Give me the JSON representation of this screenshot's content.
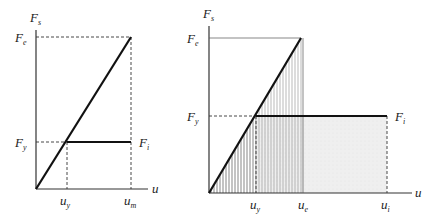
{
  "diagrams": [
    {
      "id": "left",
      "description": "Elastic vs elastoplastic force-displacement, equal displacement",
      "labels": {
        "y_axis": "F",
        "y_axis_sub": "s",
        "x_axis": "u",
        "Fe": "F",
        "Fe_sub": "e",
        "Fy": "F",
        "Fy_sub": "y",
        "Fi": "F",
        "Fi_sub": "i",
        "uy": "u",
        "uy_sub": "y",
        "um": "u",
        "um_sub": "m"
      }
    },
    {
      "id": "right",
      "description": "Elastic vs elastoplastic force-displacement, equal energy (shaded areas)",
      "labels": {
        "y_axis": "F",
        "y_axis_sub": "s",
        "x_axis": "u",
        "Fe": "F",
        "Fe_sub": "e",
        "Fy": "F",
        "Fy_sub": "y",
        "Fi": "F",
        "Fi_sub": "i",
        "uy": "u",
        "uy_sub": "y",
        "ue": "u",
        "ue_sub": "e",
        "ui": "u",
        "ui_sub": "i"
      }
    }
  ],
  "colors": {
    "line": "#111111",
    "hatch": "#888888",
    "shade": "#ebebeb"
  }
}
